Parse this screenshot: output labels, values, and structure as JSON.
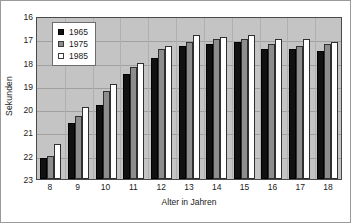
{
  "chart_data": {
    "type": "bar",
    "title": "",
    "xlabel": "Alter in Jahren",
    "ylabel": "Sekunden",
    "categories": [
      "8",
      "9",
      "10",
      "11",
      "12",
      "13",
      "14",
      "15",
      "16",
      "17",
      "18"
    ],
    "series": [
      {
        "name": "1965",
        "color": "#111111",
        "values": [
          22.1,
          20.6,
          19.8,
          18.5,
          17.8,
          17.3,
          17.2,
          17.1,
          17.4,
          17.4,
          17.5
        ]
      },
      {
        "name": "1975",
        "color": "#8d8d8d",
        "values": [
          22.0,
          20.3,
          19.2,
          18.2,
          17.4,
          17.1,
          17.0,
          17.0,
          17.2,
          17.3,
          17.2
        ]
      },
      {
        "name": "1985",
        "color": "#ffffff",
        "values": [
          21.5,
          19.9,
          18.9,
          18.0,
          17.3,
          16.8,
          16.9,
          16.8,
          17.0,
          17.0,
          17.1
        ]
      }
    ],
    "yticks": [
      "16",
      "17",
      "18",
      "19",
      "20",
      "21",
      "22",
      "23"
    ],
    "ylim": [
      16,
      23
    ],
    "y_axis_inverted": true,
    "grid": true,
    "legend_position": "inside-top-left",
    "plot_background": "#c4c4c4",
    "figure_background": "#ffffff"
  }
}
